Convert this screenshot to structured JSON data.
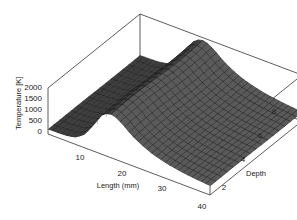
{
  "chart_data": {
    "type": "surface3d",
    "title": "",
    "xlabel": "Length (mm)",
    "ylabel": "Depth",
    "zlabel": "Temperature [K]",
    "x_ticks": [
      10,
      20,
      30,
      40
    ],
    "y_ticks": [
      2,
      4,
      6,
      8
    ],
    "z_ticks": [
      0,
      500,
      1000,
      1500,
      2000
    ],
    "xlim": [
      5,
      40
    ],
    "ylim": [
      1,
      9
    ],
    "zlim": [
      0,
      2000
    ],
    "grid": false,
    "legend": null,
    "surface_color": "#555555",
    "x": [
      5,
      7,
      9,
      11,
      13,
      15,
      17,
      19,
      21,
      23,
      25,
      27,
      29,
      31,
      33,
      35,
      37,
      39,
      40
    ],
    "y": [
      1,
      2,
      3,
      4,
      5,
      6,
      7,
      8,
      9
    ],
    "z_profile_description": "Temperature along length for each depth: low (~200 K) near length 5, rises steeply to a ridge ~1900-2000 K around length 17-19, then decays gradually to ~400 K at length 40; nearly constant across depth.",
    "z_profile_along_length": [
      200,
      210,
      230,
      300,
      600,
      1200,
      1850,
      1950,
      1700,
      1350,
      1100,
      900,
      760,
      650,
      570,
      510,
      460,
      420,
      400
    ]
  },
  "axes": {
    "z_tick_labels": [
      "0",
      "500",
      "1000",
      "1500",
      "2000"
    ],
    "x_tick_labels": [
      "10",
      "20",
      "30",
      "40"
    ],
    "y_tick_labels": [
      "2",
      "4",
      "6",
      "8"
    ],
    "x_label": "Length (mm)",
    "y_label": "Depth",
    "z_label": "Temperature [K]"
  }
}
